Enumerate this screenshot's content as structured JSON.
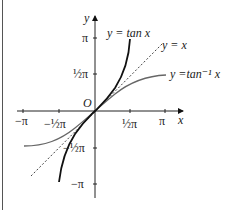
{
  "diagram": {
    "axes": {
      "x_label": "x",
      "y_label": "y",
      "origin_label": "O"
    },
    "x_ticks": [
      "−π",
      "−½π",
      "½π",
      "π"
    ],
    "y_ticks": [
      "π",
      "½π",
      "−½π",
      "−π"
    ],
    "curves": [
      {
        "name": "tan",
        "label": "y = tan x",
        "style": "solid-thick",
        "color": "#111111"
      },
      {
        "name": "identity",
        "label": "y = x",
        "style": "dashed",
        "color": "#444444"
      },
      {
        "name": "arctan",
        "label": "y =tan⁻¹ x",
        "style": "solid",
        "color": "#666666"
      }
    ]
  }
}
